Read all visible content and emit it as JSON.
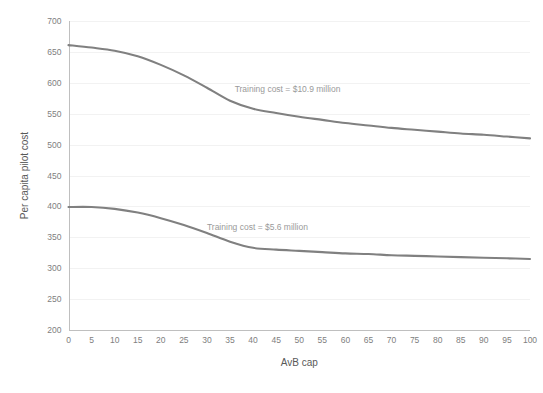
{
  "chart_data": {
    "type": "line",
    "title": "",
    "xlabel": "AvB cap",
    "ylabel": "Per capita pilot cost",
    "xlim": [
      0,
      100
    ],
    "ylim": [
      200,
      700
    ],
    "grid": true,
    "legend_position": "none",
    "x_ticks": [
      0,
      5,
      10,
      15,
      20,
      25,
      30,
      35,
      40,
      45,
      50,
      55,
      60,
      65,
      70,
      75,
      80,
      85,
      90,
      95,
      100
    ],
    "y_ticks": [
      200,
      250,
      300,
      350,
      400,
      450,
      500,
      550,
      600,
      650,
      700
    ],
    "x": [
      0,
      5,
      10,
      15,
      20,
      25,
      30,
      35,
      40,
      45,
      50,
      55,
      60,
      65,
      70,
      75,
      80,
      85,
      90,
      95,
      100
    ],
    "series": [
      {
        "name": "Training cost = $10.9 million",
        "color": "#808080",
        "values": [
          661,
          657,
          652,
          643,
          629,
          612,
          592,
          571,
          558,
          551,
          545,
          540,
          535,
          531,
          527,
          524,
          521,
          518,
          516,
          513,
          510
        ]
      },
      {
        "name": "Training cost = $5.6 million",
        "color": "#808080",
        "values": [
          399,
          399,
          396,
          390,
          381,
          370,
          357,
          343,
          333,
          330,
          328,
          326,
          324,
          323,
          321,
          320,
          319,
          318,
          317,
          316,
          315
        ]
      }
    ],
    "annotations": [
      {
        "text": "Training cost = $10.9 million",
        "x": 36,
        "y": 585
      },
      {
        "text": "Training cost = $5.6 million",
        "x": 30,
        "y": 362
      }
    ]
  },
  "colors": {
    "line": "#808080",
    "gridline": "#f2f2f2",
    "axis": "#bfbfbf",
    "tick_text": "#808080",
    "axis_title_text": "#595959",
    "annotation_text": "#9a9a9a",
    "background": "#ffffff"
  }
}
